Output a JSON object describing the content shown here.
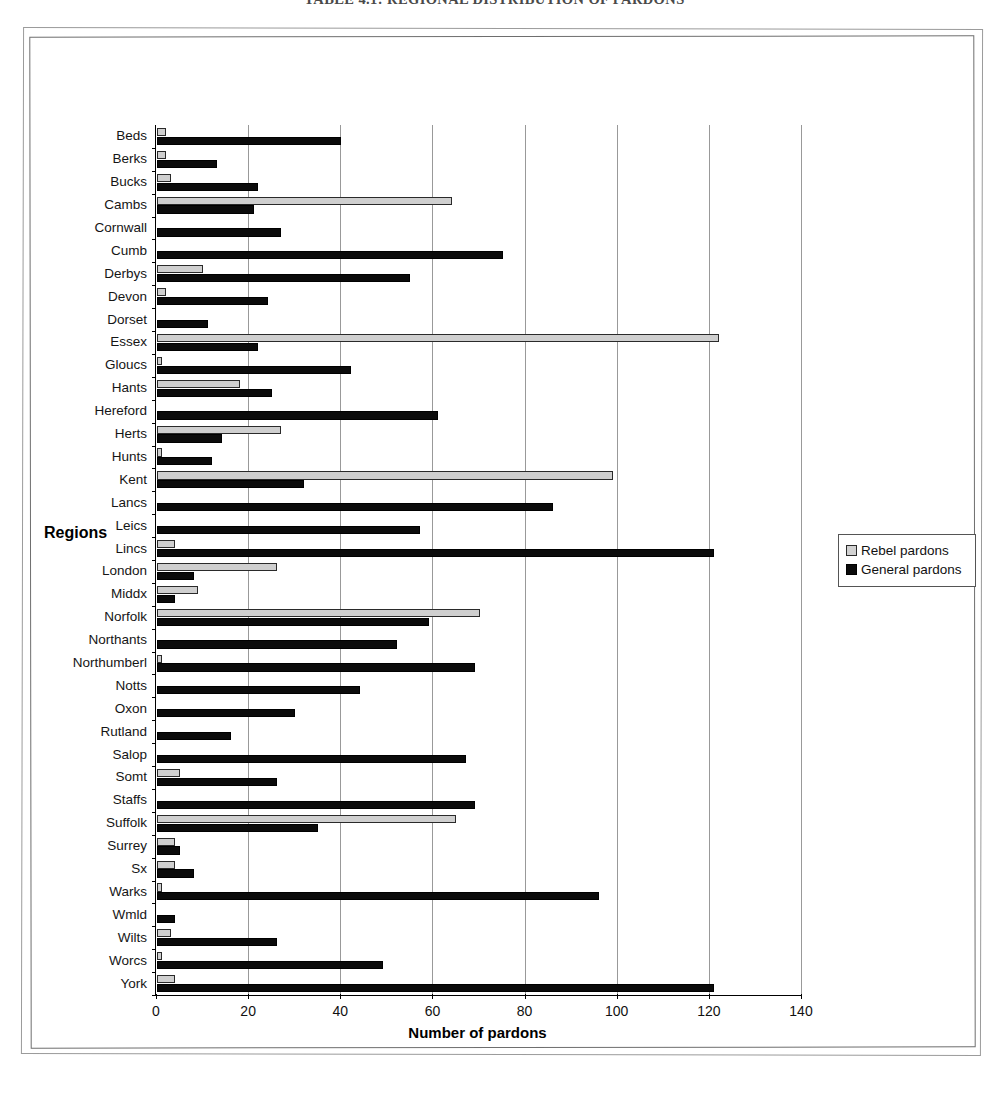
{
  "page": {
    "title": "TABLE 4.1: REGIONAL DISTRIBUTION OF PARDONS"
  },
  "legend": {
    "position": "right",
    "items": [
      {
        "label": "Rebel pardons",
        "color": "#d2d2d2",
        "icon": "legend-swatch-rebel"
      },
      {
        "label": "General pardons",
        "color": "#0b0b0b",
        "icon": "legend-swatch-general"
      }
    ]
  },
  "axes": {
    "x_title": "Number of pardons",
    "y_title": "Regions"
  },
  "chart_data": {
    "type": "bar",
    "orientation": "horizontal",
    "title": "TABLE 4.1: REGIONAL DISTRIBUTION OF PARDONS",
    "xlabel": "Number of pardons",
    "ylabel": "Regions",
    "xlim": [
      0,
      140
    ],
    "xticks": [
      0,
      20,
      40,
      60,
      80,
      100,
      120,
      140
    ],
    "grid": true,
    "legend_position": "right",
    "categories": [
      "Beds",
      "Berks",
      "Bucks",
      "Cambs",
      "Cornwall",
      "Cumb",
      "Derbys",
      "Devon",
      "Dorset",
      "Essex",
      "Gloucs",
      "Hants",
      "Hereford",
      "Herts",
      "Hunts",
      "Kent",
      "Lancs",
      "Leics",
      "Lincs",
      "London",
      "Middx",
      "Norfolk",
      "Northants",
      "Northumberl",
      "Notts",
      "Oxon",
      "Rutland",
      "Salop",
      "Somt",
      "Staffs",
      "Suffolk",
      "Surrey",
      "Sx",
      "Warks",
      "Wmld",
      "Wilts",
      "Worcs",
      "York"
    ],
    "series": [
      {
        "name": "Rebel pardons",
        "color": "#d2d2d2",
        "values": [
          2,
          2,
          3,
          64,
          0,
          0,
          10,
          2,
          0,
          122,
          1,
          18,
          0,
          27,
          1,
          99,
          0,
          0,
          4,
          26,
          9,
          70,
          0,
          1,
          0,
          0,
          0,
          0,
          5,
          0,
          65,
          4,
          4,
          1,
          0,
          3,
          1,
          4
        ]
      },
      {
        "name": "General pardons",
        "color": "#0b0b0b",
        "values": [
          40,
          13,
          22,
          21,
          27,
          75,
          55,
          24,
          11,
          22,
          42,
          25,
          61,
          14,
          12,
          32,
          86,
          57,
          121,
          8,
          4,
          59,
          52,
          69,
          44,
          30,
          16,
          67,
          26,
          69,
          35,
          5,
          8,
          96,
          4,
          26,
          49,
          121
        ]
      }
    ]
  }
}
